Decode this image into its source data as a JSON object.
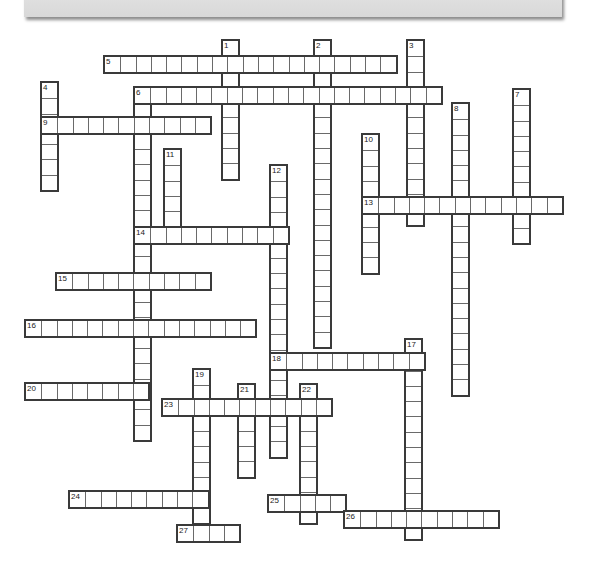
{
  "banner": {
    "title": "CROSSWORD"
  },
  "colors": {
    "cell_border": "#3a3a3a",
    "banner_bg": "#dddddd",
    "cell_bg": "#ffffff"
  },
  "puzzle": {
    "cell_size": 15.3,
    "words": [
      {
        "number": "1",
        "dir": "down",
        "x": 223,
        "y": 41,
        "length": 9
      },
      {
        "number": "2",
        "dir": "down",
        "x": 315,
        "y": 41,
        "length": 20
      },
      {
        "number": "3",
        "dir": "down",
        "x": 408,
        "y": 41,
        "length": 12
      },
      {
        "number": "4",
        "dir": "down",
        "x": 42,
        "y": 83,
        "length": 7
      },
      {
        "number": "5",
        "dir": "across",
        "x": 105,
        "y": 57,
        "length": 19
      },
      {
        "number": "6",
        "dir": "across",
        "x": 135,
        "y": 88,
        "length": 20
      },
      {
        "number": "",
        "dir": "down",
        "x": 135,
        "y": 88,
        "length": 23
      },
      {
        "number": "7",
        "dir": "down",
        "x": 514,
        "y": 90,
        "length": 10
      },
      {
        "number": "8",
        "dir": "down",
        "x": 453,
        "y": 104,
        "length": 19
      },
      {
        "number": "9",
        "dir": "across",
        "x": 42,
        "y": 118,
        "length": 11
      },
      {
        "number": "10",
        "dir": "down",
        "x": 363,
        "y": 135,
        "length": 9
      },
      {
        "number": "11",
        "dir": "down",
        "x": 165,
        "y": 150,
        "length": 5
      },
      {
        "number": "12",
        "dir": "down",
        "x": 271,
        "y": 166,
        "length": 19
      },
      {
        "number": "13",
        "dir": "across",
        "x": 363,
        "y": 198,
        "length": 13
      },
      {
        "number": "14",
        "dir": "across",
        "x": 135,
        "y": 228,
        "length": 10
      },
      {
        "number": "15",
        "dir": "across",
        "x": 57,
        "y": 274,
        "length": 10
      },
      {
        "number": "16",
        "dir": "across",
        "x": 26,
        "y": 321,
        "length": 15
      },
      {
        "number": "17",
        "dir": "down",
        "x": 406,
        "y": 340,
        "length": 13
      },
      {
        "number": "18",
        "dir": "across",
        "x": 271,
        "y": 354,
        "length": 10
      },
      {
        "number": "19",
        "dir": "down",
        "x": 194,
        "y": 370,
        "length": 10
      },
      {
        "number": "20",
        "dir": "across",
        "x": 26,
        "y": 384,
        "length": 8
      },
      {
        "number": "21",
        "dir": "down",
        "x": 239,
        "y": 385,
        "length": 6
      },
      {
        "number": "22",
        "dir": "down",
        "x": 301,
        "y": 385,
        "length": 9
      },
      {
        "number": "23",
        "dir": "across",
        "x": 163,
        "y": 400,
        "length": 11
      },
      {
        "number": "24",
        "dir": "across",
        "x": 70,
        "y": 492,
        "length": 9
      },
      {
        "number": "25",
        "dir": "across",
        "x": 269,
        "y": 496,
        "length": 5
      },
      {
        "number": "26",
        "dir": "across",
        "x": 345,
        "y": 512,
        "length": 10
      },
      {
        "number": "27",
        "dir": "across",
        "x": 178,
        "y": 526,
        "length": 4
      }
    ]
  }
}
